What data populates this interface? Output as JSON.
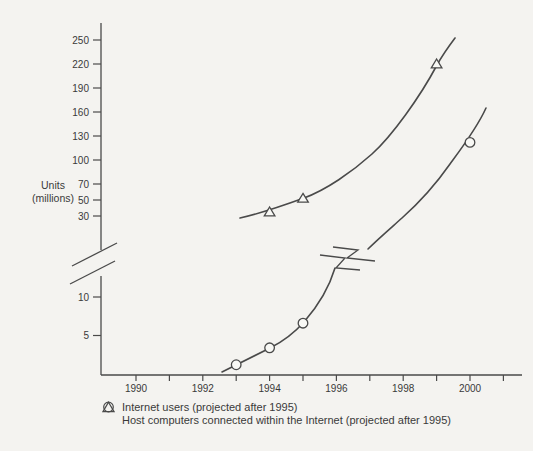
{
  "colors": {
    "line": "#4a4a4a",
    "text": "#3a3a3a",
    "background": "#f4f3f0",
    "marker_fill": "#f8f8f5"
  },
  "chart_data": {
    "type": "line",
    "title": "",
    "ylabel_lines": [
      "Units",
      "(millions)"
    ],
    "ylabel": "Units (millions)",
    "x_axis": {
      "tick_years": [
        1990,
        1991,
        1992,
        1993,
        1994,
        1995,
        1996,
        1997,
        1998,
        1999,
        2000,
        2001
      ],
      "label_years": [
        1990,
        1992,
        1994,
        1996,
        1998,
        2000
      ]
    },
    "y_axis": {
      "broken": true,
      "upper_ticks": [
        250,
        220,
        190,
        160,
        130,
        100,
        70,
        50,
        30
      ],
      "lower_ticks": [
        10,
        5
      ],
      "break_between": [
        10,
        30
      ]
    },
    "series": [
      {
        "name": "Internet users (projected after 1995)",
        "marker": "triangle",
        "points": [
          {
            "year": 1994,
            "value": 35
          },
          {
            "year": 1995,
            "value": 52
          },
          {
            "year": 1999,
            "value": 220
          }
        ]
      },
      {
        "name": "Host computers connected within the Internet (projected after 1995)",
        "marker": "circle",
        "points": [
          {
            "year": 1993,
            "value": 1.2
          },
          {
            "year": 1994,
            "value": 3.4
          },
          {
            "year": 1995,
            "value": 6.6
          },
          {
            "year": 2000,
            "value": 122
          }
        ]
      }
    ],
    "legend": [
      {
        "symbol": "triangle-outline-icon",
        "label": "Internet users (projected after 1995)"
      },
      {
        "symbol": "circle-outline-icon",
        "label": "Host computers connected within the Internet (projected after 1995)"
      }
    ]
  }
}
